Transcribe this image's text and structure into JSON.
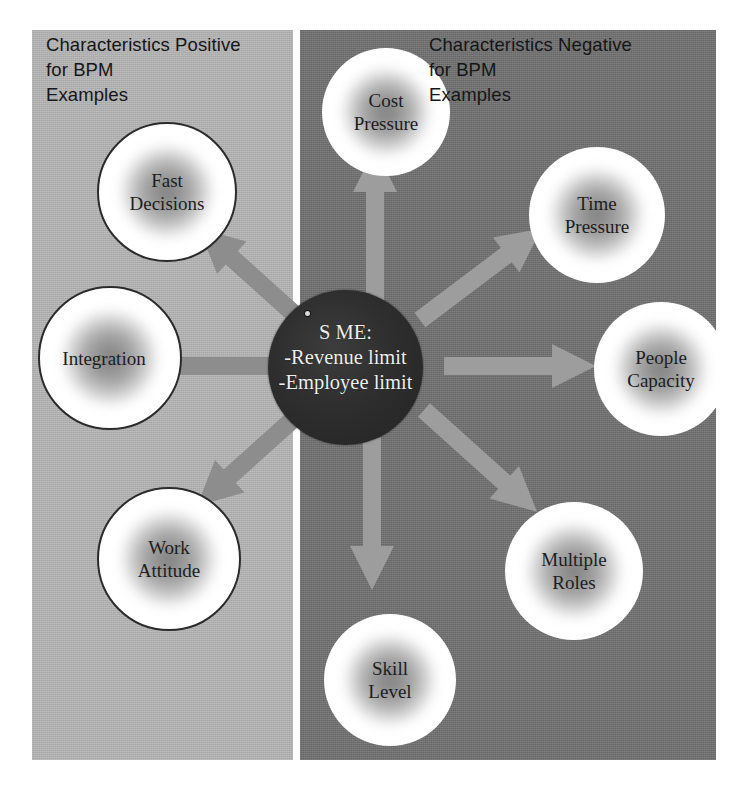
{
  "diagram": {
    "title_hidden": "SME characteristics for BPM",
    "panels": {
      "left": {
        "heading": "Characteristics Positive\nfor BPM\nExamples",
        "bg_color": "#b4b4b4"
      },
      "right": {
        "heading": "Characteristics Negative\nfor BPM\nExamples",
        "bg_color": "#6f6f6f"
      }
    },
    "center": {
      "text": "S ME:\n-Revenue limit\n-Employee limit",
      "bg_color": "#2e2e2e",
      "text_color": "#efefef"
    },
    "nodes": [
      {
        "id": "fast-decisions",
        "label": "Fast\nDecisions",
        "side": "positive"
      },
      {
        "id": "integration",
        "label": "Integration",
        "side": "positive"
      },
      {
        "id": "work-attitude",
        "label": "Work\nAttitude",
        "side": "positive"
      },
      {
        "id": "cost-pressure",
        "label": "Cost\nPressure",
        "side": "negative"
      },
      {
        "id": "time-pressure",
        "label": "Time\nPressure",
        "side": "negative"
      },
      {
        "id": "people-capacity",
        "label": "People\nCapacity",
        "side": "negative"
      },
      {
        "id": "multiple-roles",
        "label": "Multiple\nRoles",
        "side": "negative"
      },
      {
        "id": "skill-level",
        "label": "Skill\nLevel",
        "side": "negative"
      }
    ],
    "arrow_color_light_panel": "#8e8e8e",
    "arrow_color_dark_panel": "#9a9a9a",
    "divider_color": "#fdfdfd"
  }
}
